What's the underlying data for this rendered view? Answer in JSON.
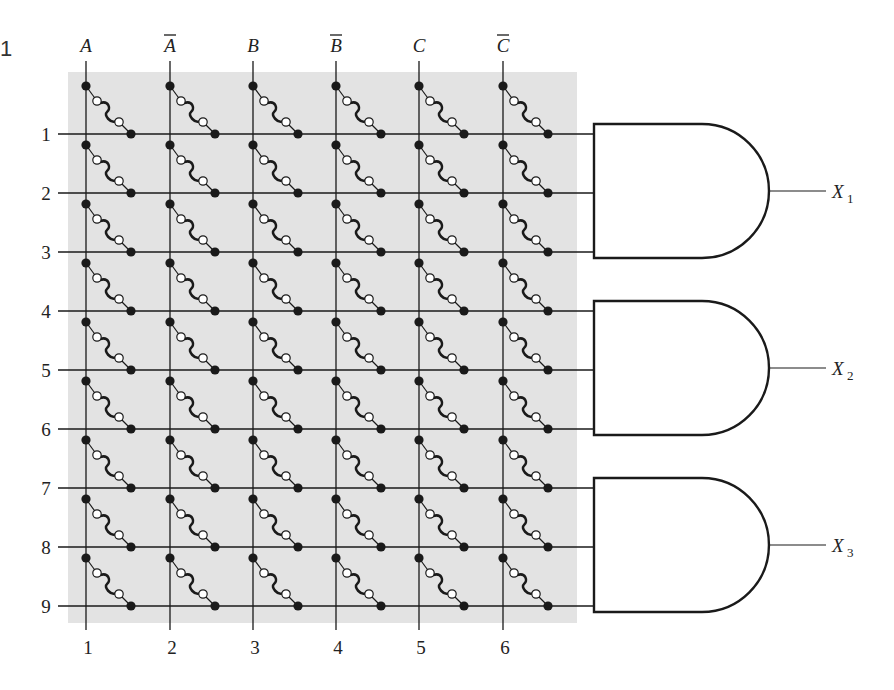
{
  "figure": {
    "number_label": "1",
    "panel_color": "#e3e3e3",
    "line_color": "#1a1a1a"
  },
  "columns": [
    {
      "label": "A",
      "bar": false,
      "number": "1",
      "x": 86
    },
    {
      "label": "A",
      "bar": true,
      "number": "2",
      "x": 170
    },
    {
      "label": "B",
      "bar": false,
      "number": "3",
      "x": 253
    },
    {
      "label": "B",
      "bar": true,
      "number": "4",
      "x": 336
    },
    {
      "label": "C",
      "bar": false,
      "number": "5",
      "x": 419
    },
    {
      "label": "C",
      "bar": true,
      "number": "6",
      "x": 503
    }
  ],
  "rows": [
    {
      "number": "1",
      "y": 134
    },
    {
      "number": "2",
      "y": 193
    },
    {
      "number": "3",
      "y": 252
    },
    {
      "number": "4",
      "y": 311
    },
    {
      "number": "5",
      "y": 370
    },
    {
      "number": "6",
      "y": 429
    },
    {
      "number": "7",
      "y": 488
    },
    {
      "number": "8",
      "y": 547
    },
    {
      "number": "9",
      "y": 606
    }
  ],
  "gates": [
    {
      "type": "AND",
      "inputs": [
        "1",
        "2",
        "3"
      ],
      "output": "X",
      "subscript": "1",
      "top": 124,
      "bottom": 258
    },
    {
      "type": "AND",
      "inputs": [
        "4",
        "5",
        "6"
      ],
      "output": "X",
      "subscript": "2",
      "top": 301,
      "bottom": 435
    },
    {
      "type": "AND",
      "inputs": [
        "7",
        "8",
        "9"
      ],
      "output": "X",
      "subscript": "3",
      "top": 478,
      "bottom": 612
    }
  ],
  "fuse": {
    "description": "intact fusible link at every column-row crossing",
    "count_per_row": 6
  }
}
